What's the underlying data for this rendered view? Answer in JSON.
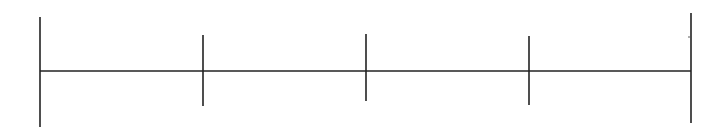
{
  "diagram": {
    "type": "number-line-segments",
    "stroke_color": "#222222",
    "background": "#ffffff",
    "axis": {
      "x1": 40,
      "x2": 691,
      "y": 71
    },
    "endpoints": [
      {
        "x": 40,
        "y1": 17,
        "y2": 127
      },
      {
        "x": 691,
        "y1": 13,
        "y2": 123
      }
    ],
    "ticks": [
      {
        "x": 203,
        "y1": 35,
        "y2": 106
      },
      {
        "x": 366,
        "y1": 34,
        "y2": 101
      },
      {
        "x": 529,
        "y1": 36,
        "y2": 105
      }
    ],
    "segments_count": 4,
    "marks": [
      {
        "x": 689,
        "y": 37
      }
    ]
  }
}
